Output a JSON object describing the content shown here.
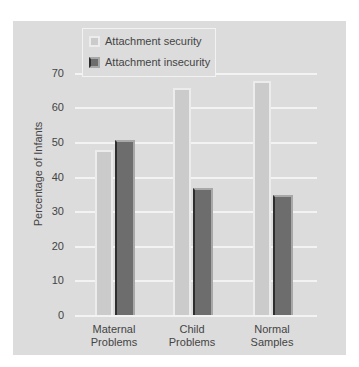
{
  "chart_data": {
    "type": "bar",
    "title": "",
    "xlabel": "",
    "ylabel": "Percentage of Infants",
    "ylim": [
      0,
      70
    ],
    "yticks": [
      0,
      10,
      20,
      30,
      40,
      50,
      60,
      70
    ],
    "categories": [
      "Maternal Problems",
      "Child Problems",
      "Normal Samples"
    ],
    "category_lines": [
      [
        "Maternal",
        "Problems"
      ],
      [
        "Child",
        "Problems"
      ],
      [
        "Normal",
        "Samples"
      ]
    ],
    "series": [
      {
        "name": "Attachment security",
        "color": "#cbcbcb",
        "values": [
          48,
          66,
          68
        ]
      },
      {
        "name": "Attachment insecurity",
        "color": "#6d6d6d",
        "values": [
          51,
          37,
          35
        ]
      }
    ],
    "grid": true,
    "legend_position": "top-left inside"
  }
}
